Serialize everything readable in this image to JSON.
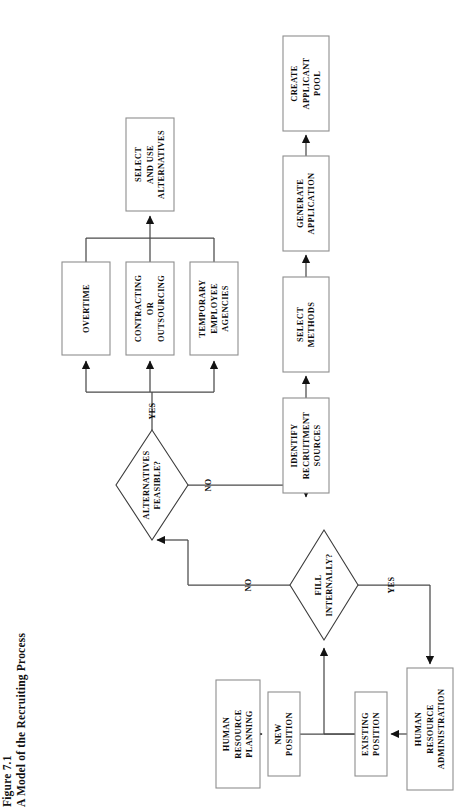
{
  "figure": {
    "number": "Figure 7.1",
    "title": "A Model of the Recruiting Process",
    "orientation": "rotated-90-ccw"
  },
  "colors": {
    "background": "#ffffff",
    "box_stroke": "#8e8e8e",
    "diamond_stroke": "#3c3c3c",
    "connector": "#4a4a4a",
    "arrowhead": "#121212",
    "text": "#0c0c0c"
  },
  "diagram": {
    "type": "flowchart",
    "reading_orientation": "text rotated 90 degrees counter-clockwise",
    "nodes": [
      {
        "id": "human-resource-planning",
        "shape": "box",
        "lines": [
          "HUMAN",
          "RESOURCE",
          "PLANNING"
        ],
        "x": 216,
        "y": 680,
        "w": 44,
        "h": 108
      },
      {
        "id": "new-position",
        "shape": "box",
        "lines": [
          "NEW",
          "POSITION"
        ],
        "x": 268,
        "y": 692,
        "w": 32,
        "h": 84
      },
      {
        "id": "existing-position",
        "shape": "box",
        "lines": [
          "EXISTING",
          "POSITION"
        ],
        "x": 355,
        "y": 692,
        "w": 32,
        "h": 84
      },
      {
        "id": "human-resource-administration",
        "shape": "box",
        "lines": [
          "HUMAN",
          "RESOURCE",
          "ADMINISTRATION"
        ],
        "x": 407,
        "y": 668,
        "w": 46,
        "h": 122
      },
      {
        "id": "fill-internally",
        "shape": "diamond",
        "lines": [
          "FILL",
          "INTERNALLY?"
        ],
        "cx": 324,
        "cy": 585,
        "rx": 34,
        "ry": 55
      },
      {
        "id": "alternatives-feasible",
        "shape": "diamond",
        "lines": [
          "ALTERNATIVES",
          "FEASIBLE?"
        ],
        "cx": 152,
        "cy": 485,
        "rx": 36,
        "ry": 55
      },
      {
        "id": "overtime",
        "shape": "box",
        "lines": [
          "OVERTIME"
        ],
        "x": 62,
        "y": 262,
        "w": 48,
        "h": 93
      },
      {
        "id": "contracting-or-outsourcing",
        "shape": "box",
        "lines": [
          "CONTRACTING",
          "OR",
          "OUTSOURCING"
        ],
        "x": 126,
        "y": 262,
        "w": 48,
        "h": 93
      },
      {
        "id": "temporary-employee-agencies",
        "shape": "box",
        "lines": [
          "TEMPORARY",
          "EMPLOYEE",
          "AGENCIES"
        ],
        "x": 190,
        "y": 262,
        "w": 48,
        "h": 93
      },
      {
        "id": "select-and-use-alternatives",
        "shape": "box",
        "lines": [
          "SELECT",
          "AND USE",
          "ALTERNATIVES"
        ],
        "x": 126,
        "y": 118,
        "w": 48,
        "h": 93
      },
      {
        "id": "identify-recruitment-sources",
        "shape": "box",
        "lines": [
          "IDENTIFY",
          "RECRUITMENT",
          "SOURCES"
        ],
        "x": 283,
        "y": 398,
        "w": 46,
        "h": 95
      },
      {
        "id": "select-methods",
        "shape": "box",
        "lines": [
          "SELECT",
          "METHODS"
        ],
        "x": 283,
        "y": 277,
        "w": 46,
        "h": 95
      },
      {
        "id": "generate-application",
        "shape": "box",
        "lines": [
          "GENERATE",
          "APPLICATION"
        ],
        "x": 283,
        "y": 156,
        "w": 46,
        "h": 95
      },
      {
        "id": "create-applicant-pool",
        "shape": "box",
        "lines": [
          "CREATE",
          "APPLICANT",
          "POOL"
        ],
        "x": 283,
        "y": 36,
        "w": 46,
        "h": 95
      }
    ],
    "edges": [
      {
        "id": "hrp-to-new-position",
        "from": "human-resource-planning",
        "to": "new-position",
        "label": ""
      },
      {
        "id": "new-position-to-fill-internally",
        "from": "new-position",
        "to": "fill-internally",
        "label": ""
      },
      {
        "id": "existing-position-to-fill-internally",
        "from": "existing-position",
        "to": "fill-internally",
        "label": ""
      },
      {
        "id": "hra-to-existing-position",
        "from": "human-resource-administration",
        "to": "existing-position",
        "label": ""
      },
      {
        "id": "fill-internally-yes-to-hra",
        "from": "fill-internally",
        "to": "human-resource-administration",
        "label": "YES"
      },
      {
        "id": "fill-internally-no-to-alternatives",
        "from": "fill-internally",
        "to": "alternatives-feasible",
        "label": "NO"
      },
      {
        "id": "alternatives-no-to-identify-sources",
        "from": "alternatives-feasible",
        "to": "identify-recruitment-sources",
        "label": "NO"
      },
      {
        "id": "alternatives-yes-to-options",
        "from": "alternatives-feasible",
        "to": "alternative-options",
        "label": "YES"
      },
      {
        "id": "options-to-select-and-use",
        "from": "alternative-options",
        "to": "select-and-use-alternatives",
        "label": ""
      },
      {
        "id": "identify-to-select-methods",
        "from": "identify-recruitment-sources",
        "to": "select-methods",
        "label": ""
      },
      {
        "id": "select-methods-to-generate",
        "from": "select-methods",
        "to": "generate-application",
        "label": ""
      },
      {
        "id": "generate-to-pool",
        "from": "generate-application",
        "to": "create-applicant-pool",
        "label": ""
      }
    ],
    "edge_labels": [
      {
        "id": "label-yes-fill-internally",
        "text": "YES",
        "x": 391,
        "y": 585
      },
      {
        "id": "label-no-fill-internally",
        "text": "NO",
        "x": 248,
        "y": 585
      },
      {
        "id": "label-no-alternatives",
        "text": "NO",
        "x": 208,
        "y": 485
      },
      {
        "id": "label-yes-alternatives",
        "text": "YES",
        "x": 152,
        "y": 411
      }
    ]
  }
}
